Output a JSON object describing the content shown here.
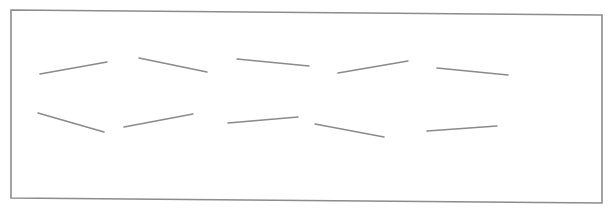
{
  "figure": {
    "width": 614,
    "height": 215,
    "background": "#ffffff",
    "frame": {
      "points": [
        [
          11,
          10
        ],
        [
          602,
          15
        ],
        [
          602,
          203
        ],
        [
          11,
          198
        ]
      ],
      "stroke": "#8c8c8c",
      "stroke_width": 1.6
    },
    "segment_style": {
      "stroke": "#8a8a8a",
      "stroke_width": 1.5
    },
    "rows": [
      {
        "name": "row-1",
        "segments": [
          {
            "x1": 40,
            "y1": 74,
            "x2": 107,
            "y2": 62
          },
          {
            "x1": 139,
            "y1": 58,
            "x2": 207,
            "y2": 72
          },
          {
            "x1": 237,
            "y1": 59,
            "x2": 309,
            "y2": 66
          },
          {
            "x1": 338,
            "y1": 73,
            "x2": 408,
            "y2": 61
          },
          {
            "x1": 437,
            "y1": 68,
            "x2": 508,
            "y2": 75
          }
        ]
      },
      {
        "name": "row-2",
        "segments": [
          {
            "x1": 38,
            "y1": 113,
            "x2": 104,
            "y2": 132
          },
          {
            "x1": 124,
            "y1": 127,
            "x2": 193,
            "y2": 114
          },
          {
            "x1": 228,
            "y1": 123,
            "x2": 298,
            "y2": 117
          },
          {
            "x1": 315,
            "y1": 124,
            "x2": 384,
            "y2": 137
          },
          {
            "x1": 427,
            "y1": 131,
            "x2": 497,
            "y2": 126
          }
        ]
      }
    ]
  }
}
